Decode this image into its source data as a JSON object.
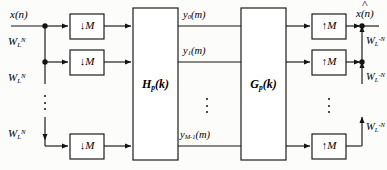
{
  "figure": {
    "type": "block-diagram",
    "background_color": "#fcfcfb",
    "line_color": "#1a1a1a"
  },
  "labels": {
    "input_signal": "x(n)",
    "output_signal": "x(n)",
    "output_signal_hat": true,
    "twiddle_in": "W",
    "twiddle_in_sub": "L",
    "twiddle_in_sup": "N",
    "twiddle_out_sup": "-N",
    "decimator": "M",
    "decimator_arrow": "↓",
    "interpolator": "M",
    "interpolator_arrow": "↑",
    "analysis_block": "H",
    "analysis_block_sub": "p",
    "analysis_block_arg": "(k)",
    "synthesis_block": "G",
    "synthesis_block_sub": "p",
    "synthesis_block_arg": "(k)",
    "y0": "y",
    "y0_sub": "0",
    "y0_arg": "(m)",
    "y1": "y",
    "y1_sub": "1",
    "y1_arg": "(m)",
    "ylast": "y",
    "ylast_sub": "M-1",
    "ylast_arg": "(m)",
    "ellipsis": "⋮"
  },
  "analysis_branches": [
    {
      "id": "branch-0",
      "twiddle": "W",
      "twiddle_sub": "L",
      "twiddle_sup": "N",
      "decimator": "↓M",
      "output": "y",
      "output_sub": "0",
      "output_arg": "(m)"
    },
    {
      "id": "branch-1",
      "twiddle": "W",
      "twiddle_sub": "L",
      "twiddle_sup": "N",
      "decimator": "↓M",
      "output": "y",
      "output_sub": "1",
      "output_arg": "(m)"
    },
    {
      "id": "branch-last",
      "twiddle": "W",
      "twiddle_sub": "L",
      "twiddle_sup": "N",
      "decimator": "↓M",
      "output": "y",
      "output_sub": "M-1",
      "output_arg": "(m)"
    }
  ],
  "synthesis_branches": [
    {
      "id": "syn-branch-0",
      "interpolator": "↑M",
      "twiddle": "W",
      "twiddle_sub": "L",
      "twiddle_sup": "-N"
    },
    {
      "id": "syn-branch-1",
      "interpolator": "↑M",
      "twiddle": "W",
      "twiddle_sub": "L",
      "twiddle_sup": "-N"
    },
    {
      "id": "syn-branch-last",
      "interpolator": "↑M",
      "twiddle": "W",
      "twiddle_sub": "L",
      "twiddle_sup": "-N"
    }
  ]
}
